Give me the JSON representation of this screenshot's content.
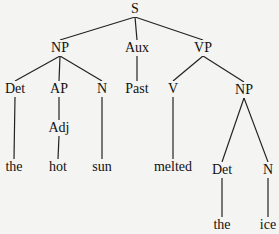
{
  "diagram": {
    "type": "syntax-tree",
    "sentence": "the hot sun melted the ice",
    "nodes": [
      {
        "id": "S",
        "label": "S",
        "x": 135,
        "y": 9
      },
      {
        "id": "NP1",
        "label": "NP",
        "x": 60,
        "y": 48
      },
      {
        "id": "Aux",
        "label": "Aux",
        "x": 137,
        "y": 48
      },
      {
        "id": "VP",
        "label": "VP",
        "x": 203,
        "y": 48
      },
      {
        "id": "Det1",
        "label": "Det",
        "x": 15,
        "y": 89
      },
      {
        "id": "AP",
        "label": "AP",
        "x": 59,
        "y": 89
      },
      {
        "id": "N1",
        "label": "N",
        "x": 102,
        "y": 89
      },
      {
        "id": "Past",
        "label": "Past",
        "x": 137,
        "y": 89
      },
      {
        "id": "V",
        "label": "V",
        "x": 173,
        "y": 89
      },
      {
        "id": "NP2",
        "label": "NP",
        "x": 244,
        "y": 90
      },
      {
        "id": "Adj",
        "label": "Adj",
        "x": 59,
        "y": 128
      },
      {
        "id": "the1",
        "label": "the",
        "x": 14,
        "y": 167
      },
      {
        "id": "hot",
        "label": "hot",
        "x": 58,
        "y": 167
      },
      {
        "id": "sun",
        "label": "sun",
        "x": 102,
        "y": 167
      },
      {
        "id": "melted",
        "label": "melted",
        "x": 173,
        "y": 167
      },
      {
        "id": "Det2",
        "label": "Det",
        "x": 222,
        "y": 170
      },
      {
        "id": "N2",
        "label": "N",
        "x": 268,
        "y": 170
      },
      {
        "id": "the2",
        "label": "the",
        "x": 222,
        "y": 225
      },
      {
        "id": "ice",
        "label": "ice",
        "x": 268,
        "y": 225
      }
    ],
    "edges": [
      [
        "S",
        "NP1"
      ],
      [
        "S",
        "Aux"
      ],
      [
        "S",
        "VP"
      ],
      [
        "NP1",
        "Det1"
      ],
      [
        "NP1",
        "AP"
      ],
      [
        "NP1",
        "N1"
      ],
      [
        "Aux",
        "Past"
      ],
      [
        "VP",
        "V"
      ],
      [
        "VP",
        "NP2"
      ],
      [
        "AP",
        "Adj"
      ],
      [
        "Det1",
        "the1"
      ],
      [
        "Adj",
        "hot"
      ],
      [
        "N1",
        "sun"
      ],
      [
        "V",
        "melted"
      ],
      [
        "NP2",
        "Det2"
      ],
      [
        "NP2",
        "N2"
      ],
      [
        "Det2",
        "the2"
      ],
      [
        "N2",
        "ice"
      ]
    ]
  },
  "labels": {
    "S": "S",
    "NP1": "NP",
    "Aux": "Aux",
    "VP": "VP",
    "Det1": "Det",
    "AP": "AP",
    "N1": "N",
    "Past": "Past",
    "V": "V",
    "NP2": "NP",
    "Adj": "Adj",
    "the1": "the",
    "hot": "hot",
    "sun": "sun",
    "melted": "melted",
    "Det2": "Det",
    "N2": "N",
    "the2": "the",
    "ice": "ice"
  }
}
